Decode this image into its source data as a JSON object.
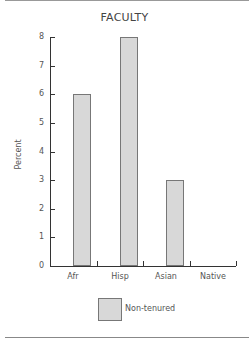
{
  "chart_data": {
    "type": "bar",
    "title": "FACULTY",
    "xlabel": "",
    "ylabel": "Percent",
    "categories": [
      "Afr",
      "Hisp",
      "Asian",
      "Native"
    ],
    "series": [
      {
        "name": "Non-tenured",
        "values": [
          6,
          8,
          3,
          0
        ],
        "color": "#d8d8d8"
      }
    ],
    "ylim": [
      0,
      8
    ],
    "yticks": [
      "0",
      "1",
      "2",
      "3",
      "4",
      "5",
      "6",
      "7",
      "8"
    ],
    "grid": false,
    "legend_position": "bottom"
  }
}
